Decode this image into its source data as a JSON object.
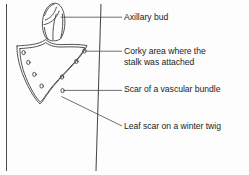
{
  "figure": {
    "title": "Leaf scar on a winter twig",
    "colors": {
      "background": "#fdfdfd",
      "stroke": "#3b3b3b",
      "leader": "#55555a",
      "text": "#1c1c1c"
    }
  },
  "labels": [
    {
      "id": "axillary-bud",
      "text": "Axillary bud",
      "lines": [
        "Axillary bud"
      ]
    },
    {
      "id": "corky-area",
      "text": "Corky area where the stalk was attached",
      "lines": [
        "Corky area where the",
        "stalk was attached"
      ]
    },
    {
      "id": "vascular-bundle",
      "text": "Scar of a vascular bundle",
      "lines": [
        "Scar of a vascular bundle"
      ]
    },
    {
      "id": "leaf-scar",
      "text": "Leaf scar on a winter twig",
      "lines": [
        "Leaf scar on a winter twig"
      ]
    }
  ],
  "parts": {
    "twig_left_edge": "twig left edge line",
    "twig_right_edge": "twig right edge line",
    "bud": "axillary bud with overlapping scales",
    "leaf_scar": "shield shaped leaf scar outline",
    "bundle_scars_count": 8
  }
}
